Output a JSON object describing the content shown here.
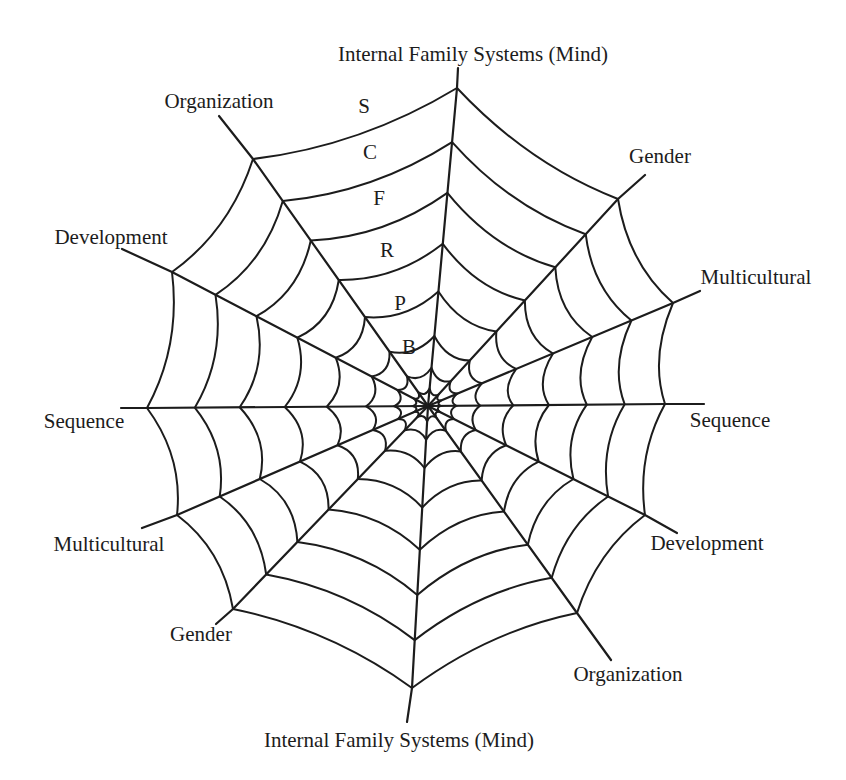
{
  "figure": {
    "background": "#ffffff",
    "ink": "#1c1c1c",
    "center": [
      428,
      406
    ],
    "ring_fractions": [
      1.0,
      0.83,
      0.67,
      0.51,
      0.36,
      0.22,
      0.12,
      0.055
    ],
    "ring_sag": [
      0.08,
      0.09,
      0.11,
      0.13,
      0.16,
      0.21,
      0.3,
      0.42
    ],
    "ring_stroke_width": 2.0,
    "spoke_stroke_width": 2.2,
    "label_font_size": 21,
    "letter_font_size": 21,
    "spokes": [
      {
        "id": "ifs-top",
        "label": "Internal Family Systems (Mind)",
        "vertex": [
          457,
          88
        ],
        "tip": [
          458,
          68
        ],
        "label_pos": [
          473,
          54
        ]
      },
      {
        "id": "gender-upper-right",
        "label": "Gender",
        "vertex": [
          618,
          199
        ],
        "tip": [
          645,
          175
        ],
        "label_pos": [
          660,
          156
        ]
      },
      {
        "id": "multicultural-right",
        "label": "Multicultural",
        "vertex": [
          673,
          303
        ],
        "tip": [
          700,
          291
        ],
        "label_pos": [
          756,
          277
        ]
      },
      {
        "id": "sequence-right",
        "label": "Sequence",
        "vertex": [
          665,
          404
        ],
        "tip": [
          704,
          404
        ],
        "label_pos": [
          730,
          420
        ]
      },
      {
        "id": "development-lower-right",
        "label": "Development",
        "vertex": [
          645,
          515
        ],
        "tip": [
          677,
          533
        ],
        "label_pos": [
          707,
          543
        ]
      },
      {
        "id": "organization-lower-right",
        "label": "Organization",
        "vertex": [
          577,
          613
        ],
        "tip": [
          611,
          660
        ],
        "label_pos": [
          628,
          674
        ]
      },
      {
        "id": "ifs-bottom",
        "label": "Internal Family Systems (Mind)",
        "vertex": [
          412,
          688
        ],
        "tip": [
          407,
          722
        ],
        "label_pos": [
          399,
          740
        ]
      },
      {
        "id": "gender-lower-left",
        "label": "Gender",
        "vertex": [
          233,
          609
        ],
        "tip": [
          216,
          624
        ],
        "label_pos": [
          201,
          634
        ]
      },
      {
        "id": "multicultural-lower-left",
        "label": "Multicultural",
        "vertex": [
          177,
          515
        ],
        "tip": [
          142,
          528
        ],
        "label_pos": [
          109,
          544
        ]
      },
      {
        "id": "sequence-left",
        "label": "Sequence",
        "vertex": [
          147,
          408
        ],
        "tip": [
          121,
          408
        ],
        "label_pos": [
          84,
          421
        ]
      },
      {
        "id": "development-upper-left",
        "label": "Development",
        "vertex": [
          172,
          272
        ],
        "tip": [
          122,
          249
        ],
        "label_pos": [
          111,
          237
        ]
      },
      {
        "id": "organization-upper-left",
        "label": "Organization",
        "vertex": [
          253,
          159
        ],
        "tip": [
          219,
          116
        ],
        "label_pos": [
          219,
          101
        ]
      }
    ],
    "ring_letters": [
      {
        "letter": "S",
        "pos": [
          364,
          106
        ]
      },
      {
        "letter": "C",
        "pos": [
          370,
          152
        ]
      },
      {
        "letter": "F",
        "pos": [
          379,
          198
        ]
      },
      {
        "letter": "R",
        "pos": [
          387,
          250
        ]
      },
      {
        "letter": "P",
        "pos": [
          400,
          303
        ]
      },
      {
        "letter": "B",
        "pos": [
          409,
          347
        ]
      }
    ]
  }
}
